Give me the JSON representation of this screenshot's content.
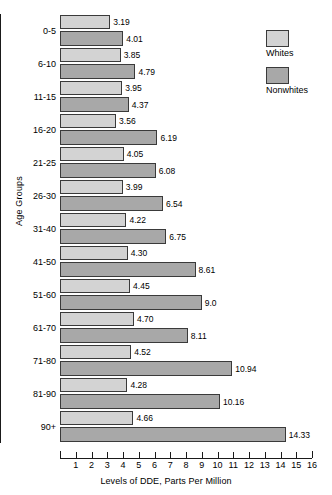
{
  "chart_data": {
    "type": "bar",
    "orientation": "horizontal",
    "title": "",
    "xlabel": "Levels of DDE, Parts Per Million",
    "ylabel": "Age Groups",
    "xlim": [
      0,
      16
    ],
    "xticks": [
      1,
      2,
      3,
      4,
      5,
      6,
      7,
      8,
      9,
      10,
      11,
      12,
      13,
      14,
      15,
      16
    ],
    "grid": false,
    "legend_position": "right-top",
    "categories": [
      "0-5",
      "6-10",
      "11-15",
      "16-20",
      "21-25",
      "26-30",
      "31-40",
      "41-50",
      "51-60",
      "61-70",
      "71-80",
      "81-90",
      "90+"
    ],
    "series": [
      {
        "name": "Whites",
        "color": "#d3d3d3",
        "values": [
          3.19,
          3.85,
          3.95,
          3.56,
          4.05,
          3.99,
          4.22,
          4.3,
          4.45,
          4.7,
          4.52,
          4.28,
          4.66
        ],
        "labels": [
          "3.19",
          "3.85",
          "3.95",
          "3.56",
          "4.05",
          "3.99",
          "4.22",
          "4.30",
          "4.45",
          "4.70",
          "4.52",
          "4.28",
          "4.66"
        ]
      },
      {
        "name": "Nonwhites",
        "color": "#a8a8a8",
        "values": [
          4.01,
          4.79,
          4.37,
          6.19,
          6.08,
          6.54,
          6.75,
          8.61,
          9.0,
          8.11,
          10.94,
          10.16,
          14.33
        ],
        "labels": [
          "4.01",
          "4.79",
          "4.37",
          "6.19",
          "6.08",
          "6.54",
          "6.75",
          "8.61",
          "9.0",
          "8.11",
          "10.94",
          "10.16",
          "14.33"
        ]
      }
    ]
  },
  "legend": {
    "items": [
      {
        "label": "Whites",
        "color": "#d3d3d3"
      },
      {
        "label": "Nonwhites",
        "color": "#a8a8a8"
      }
    ]
  }
}
